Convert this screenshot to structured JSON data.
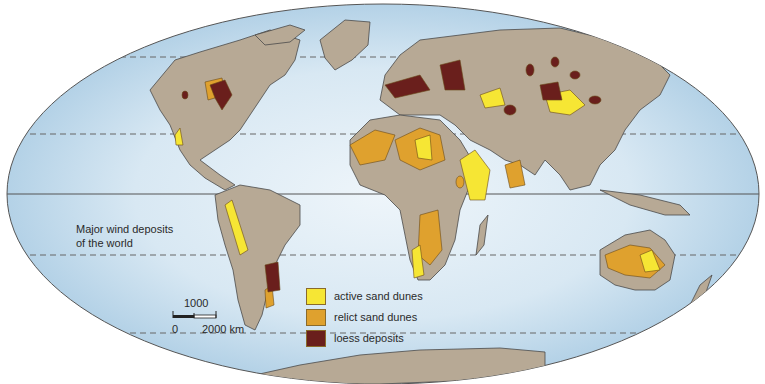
{
  "map": {
    "title_line1": "Major wind deposits",
    "title_line2": "of the world",
    "projection": "equal-area oval world map",
    "colors": {
      "ocean_edge": "#a9cbe3",
      "ocean_center": "#e6f1f8",
      "land": "#b7a995",
      "coastline": "#4a4a4a",
      "active_sand_dunes": "#f6e634",
      "relict_sand_dunes": "#dfa12e",
      "loess_deposits": "#6a1f1c",
      "graticule": "#555555"
    }
  },
  "legend": {
    "items": [
      {
        "label": "active sand dunes",
        "color": "#f6e634"
      },
      {
        "label": "relict sand dunes",
        "color": "#dfa12e"
      },
      {
        "label": "loess deposits",
        "color": "#6a1f1c"
      }
    ]
  },
  "scale": {
    "mid_label": "1000",
    "start_label": "0",
    "end_label": "2000 km"
  }
}
